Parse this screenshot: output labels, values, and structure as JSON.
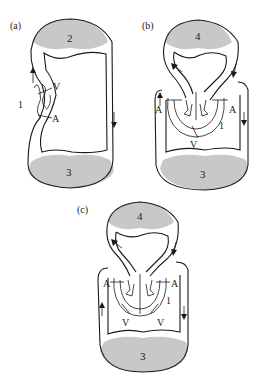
{
  "figure": {
    "panels": [
      {
        "id": "a",
        "label": "(a)",
        "capillary_beds": [
          {
            "position": "top",
            "number": "2"
          },
          {
            "position": "bottom",
            "number": "3"
          }
        ],
        "heart_labels": {
          "vessel_marker": "1",
          "ventricle": "V",
          "atrium": "A"
        },
        "flow_arrows": [
          "up-left",
          "down-right"
        ]
      },
      {
        "id": "b",
        "label": "(b)",
        "capillary_beds": [
          {
            "position": "top",
            "number": "4"
          },
          {
            "position": "bottom",
            "number": "3"
          }
        ],
        "heart_labels": {
          "atrium_left": "A",
          "atrium_right": "A",
          "ventricle": "V",
          "vessel_marker": "1"
        },
        "flow_arrows": [
          "up-left-outer",
          "down-right-outer",
          "left-top-loop",
          "down-top-loop"
        ]
      },
      {
        "id": "c",
        "label": "(c)",
        "capillary_beds": [
          {
            "position": "top",
            "number": "4"
          },
          {
            "position": "bottom",
            "number": "3"
          }
        ],
        "heart_labels": {
          "atrium_left": "A",
          "atrium_right": "A",
          "ventricle_left": "V",
          "ventricle_right": "V",
          "vessel_marker": "1"
        },
        "flow_arrows": [
          "up-left-outer",
          "down-right-outer",
          "left-top-loop",
          "down-top-loop"
        ]
      }
    ],
    "colors": {
      "capillary_fill": "#c8c8c8",
      "line": "#1a1a1a",
      "background": "#ffffff"
    }
  }
}
